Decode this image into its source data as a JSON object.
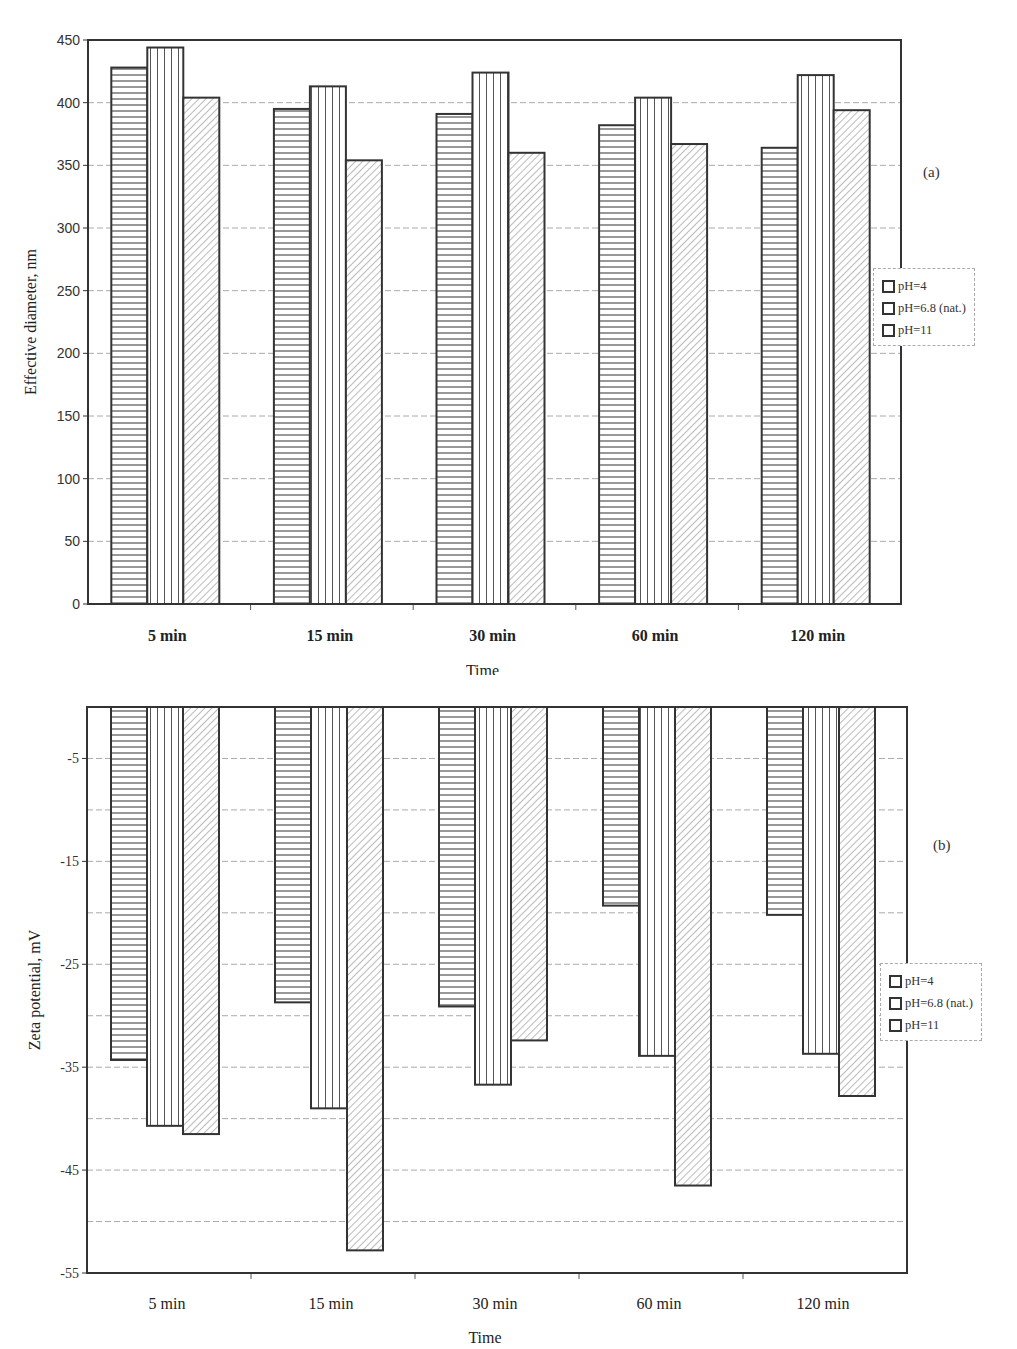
{
  "page": {
    "corner_mark": ""
  },
  "chart_data": [
    {
      "type": "bar",
      "panel_label": "(a)",
      "title": "",
      "xlabel": "Time",
      "ylabel": "Effective diameter, nm",
      "categories": [
        "5 min",
        "15 min",
        "30 min",
        "60 min",
        "120 min"
      ],
      "series": [
        {
          "name": "pH=4",
          "pattern": "horizontal-lines",
          "values": [
            428,
            395,
            391,
            382,
            364
          ]
        },
        {
          "name": "pH=6.8 (nat.)",
          "pattern": "vertical-lines",
          "values": [
            444,
            413,
            424,
            404,
            422
          ]
        },
        {
          "name": "pH=11",
          "pattern": "diagonal-hatch",
          "values": [
            404,
            354,
            360,
            367,
            394
          ]
        }
      ],
      "ylim": [
        0,
        450
      ],
      "yticks": [
        0,
        50,
        100,
        150,
        200,
        250,
        300,
        350,
        400,
        450
      ],
      "grid": true,
      "legend_position": "right"
    },
    {
      "type": "bar",
      "panel_label": "(b)",
      "title": "",
      "xlabel": "Time",
      "ylabel": "Zeta potential, mV",
      "categories": [
        "5 min",
        "15 min",
        "30 min",
        "60 min",
        "120 min"
      ],
      "series": [
        {
          "name": "pH=4",
          "pattern": "horizontal-lines",
          "values": [
            -34.3,
            -28.7,
            -29.1,
            -19.3,
            -20.2
          ]
        },
        {
          "name": "pH=6.8 (nat.)",
          "pattern": "vertical-lines",
          "values": [
            -40.7,
            -39.0,
            -36.7,
            -33.9,
            -33.7
          ]
        },
        {
          "name": "pH=11",
          "pattern": "diagonal-hatch",
          "values": [
            -41.5,
            -52.8,
            -32.4,
            -46.5,
            -37.8
          ]
        }
      ],
      "ylim": [
        -55,
        0
      ],
      "yticks": [
        -5,
        -15,
        -25,
        -35,
        -45,
        -55
      ],
      "grid": true,
      "legend_position": "right"
    }
  ]
}
